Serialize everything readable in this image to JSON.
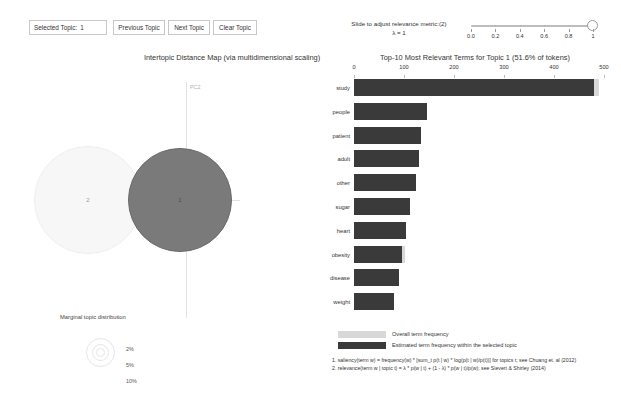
{
  "controls": {
    "selected_topic_label": "Selected Topic:",
    "selected_topic_value": "1",
    "previous_topic": "Previous Topic",
    "next_topic": "Next Topic",
    "clear_topic": "Clear Topic"
  },
  "lambda_slider": {
    "prompt": "Slide to adjust relevance metric:(2)",
    "value_line": "λ = 1",
    "value": 1,
    "min": 0,
    "max": 1,
    "ticks": [
      "0.0",
      "0.2",
      "0.4",
      "0.6",
      "0.8",
      "1"
    ]
  },
  "mds_panel": {
    "title": "Intertopic Distance Map (via multidimensional scaling)",
    "axis_x_label": "PC1",
    "axis_y_label": "PC2",
    "topics": [
      {
        "id": "1",
        "label": "1",
        "selected": true
      },
      {
        "id": "2",
        "label": "2",
        "selected": false
      }
    ],
    "marginal": {
      "title": "Marginal topic distribution",
      "sizes": [
        "2%",
        "5%",
        "10%"
      ]
    }
  },
  "bar_panel": {
    "title": "Top-10 Most Relevant Terms for Topic 1 (51.6% of tokens)",
    "legend": {
      "overall": "Overall term frequency",
      "topic": "Estimated term frequency within the selected topic"
    },
    "footnotes": [
      "1. saliency(term w) = frequency(w) * [sum_t p(t | w) * log(p(t | w)/p(t))] for topics t; see Chuang et. al (2012)",
      "2. relevance(term w | topic t) = λ * p(w | t) + (1 - λ) * p(w | t)/p(w); see Sievert & Shirley (2014)"
    ]
  },
  "chart_data": {
    "type": "bar",
    "title": "Top-10 Most Relevant Terms for Topic 1 (51.6% of tokens)",
    "orientation": "horizontal",
    "xlabel": "",
    "ylabel": "",
    "xlim": [
      0,
      500
    ],
    "xticks": [
      0,
      100,
      200,
      300,
      400,
      500
    ],
    "grid": false,
    "legend_position": "bottom-left",
    "categories": [
      "study",
      "people",
      "patient",
      "adult",
      "other",
      "sugar",
      "heart",
      "obesity",
      "disease",
      "weight"
    ],
    "series": [
      {
        "name": "Overall term frequency",
        "color": "#d8d8d8",
        "values": [
          489,
          146,
          134,
          129,
          123,
          112,
          104,
          102,
          90,
          80
        ]
      },
      {
        "name": "Estimated term frequency within the selected topic",
        "color": "#3a3a3a",
        "values": [
          480,
          146,
          134,
          129,
          123,
          112,
          104,
          96,
          90,
          80
        ]
      }
    ]
  }
}
